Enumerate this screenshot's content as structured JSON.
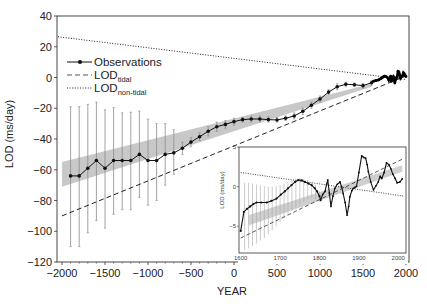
{
  "chart_data": [
    {
      "type": "line",
      "role": "main",
      "title": "",
      "xlabel": "YEAR",
      "ylabel": "LOD (ms/day)",
      "xlim": [
        -2000,
        2000
      ],
      "ylim": [
        -120,
        40
      ],
      "xticks": [
        -2000,
        -1500,
        -1000,
        -500,
        0,
        500,
        1000,
        1500,
        2000
      ],
      "xtick_labels": [
        "−2000",
        "−1500",
        "−1000",
        "−500",
        "0",
        "500",
        "1000",
        "1500",
        "2000"
      ],
      "yticks": [
        -120,
        -100,
        -80,
        -60,
        -40,
        -20,
        0,
        20,
        40
      ],
      "ytick_labels": [
        "−120",
        "−100",
        "−80",
        "−60",
        "−40",
        "−20",
        "0",
        "20",
        "40"
      ],
      "grid": false,
      "legend_position": "upper left",
      "legend": [
        {
          "label": "Observations",
          "sub": "",
          "style": "line-marker"
        },
        {
          "label": "LOD",
          "sub": "tidal",
          "style": "dashed"
        },
        {
          "label": "LOD",
          "sub": "non-tidal",
          "style": "dotted"
        }
      ],
      "series": [
        {
          "name": "Observations",
          "style": "line-marker",
          "x": [
            -1900,
            -1800,
            -1700,
            -1600,
            -1500,
            -1400,
            -1300,
            -1200,
            -1100,
            -1000,
            -900,
            -800,
            -700,
            -600,
            -500,
            -400,
            -300,
            -200,
            -100,
            0,
            100,
            200,
            300,
            400,
            500,
            600,
            700,
            800,
            900,
            1000,
            1100,
            1200,
            1300,
            1400,
            1500,
            1600
          ],
          "y": [
            -64,
            -64,
            -59,
            -54,
            -59,
            -54,
            -54,
            -54,
            -50,
            -54,
            -54,
            -50,
            -49,
            -46,
            -42,
            -38.5,
            -35,
            -32,
            -30.5,
            -28.7,
            -27.4,
            -27,
            -27,
            -27.4,
            -27.6,
            -26.5,
            -25,
            -22,
            -18,
            -14,
            -9.5,
            -6,
            -4.4,
            -4.7,
            -5.3,
            -3.4
          ],
          "err_low": [
            -110,
            -110,
            -101,
            -93,
            -98,
            -89,
            -86,
            -86,
            -78,
            -83,
            -80,
            -70,
            -63,
            -50,
            -45,
            -41,
            -38,
            -35,
            -33,
            -31,
            -29,
            -29,
            -29,
            -29,
            -29,
            -28,
            -27,
            -24,
            -20,
            -16,
            -11,
            -8,
            -6,
            -6,
            -7,
            -5
          ],
          "err_high": [
            -19,
            -19,
            -17.5,
            -16,
            -21,
            -19.6,
            -23,
            -22.6,
            -21.8,
            -27,
            -30,
            -30,
            -34,
            -42,
            -39,
            -36,
            -32,
            -29,
            -28,
            -26.5,
            -26,
            -25,
            -25,
            -25.5,
            -26,
            -25,
            -23,
            -20,
            -16,
            -12,
            -8,
            -4,
            -3,
            -3.5,
            -4,
            -2
          ]
        },
        {
          "name": "Observations (telescopic, 1620-2000)",
          "style": "dense-markers",
          "x": [
            1620,
            1650,
            1680,
            1710,
            1730,
            1750,
            1770,
            1790,
            1800,
            1815,
            1822,
            1830,
            1840,
            1852,
            1860,
            1870,
            1878,
            1886,
            1895,
            1907,
            1917,
            1925,
            1937,
            1950,
            1958,
            1970,
            1981,
            1992,
            2000
          ],
          "y": [
            -2.5,
            -2.0,
            -1.6,
            -0.6,
            0.2,
            0.85,
            0.6,
            -0.4,
            -1.7,
            -0.6,
            0.85,
            -2.5,
            -0.2,
            0.6,
            -0.85,
            -3.6,
            -1.3,
            -0.2,
            0.05,
            3.9,
            3.6,
            1.9,
            -0.4,
            0.6,
            1.05,
            3.0,
            2.3,
            1.05,
            0.6
          ]
        },
        {
          "name": "LOD_tidal",
          "style": "dashed",
          "x": [
            -2000,
            2000
          ],
          "y": [
            -90,
            1
          ]
        },
        {
          "name": "LOD_non-tidal",
          "style": "dotted",
          "x": [
            -2000,
            2000
          ],
          "y": [
            26.5,
            -1.3
          ]
        },
        {
          "name": "Uncertainty band",
          "style": "band",
          "x": [
            -2000,
            1600
          ],
          "upper": [
            -55,
            -4
          ],
          "lower": [
            -71,
            -6
          ]
        }
      ]
    },
    {
      "type": "line",
      "role": "inset",
      "title": "",
      "xlabel": "",
      "ylabel": "LOD (ms/day)",
      "xlim": [
        1600,
        2015
      ],
      "ylim": [
        -7.5,
        5.5
      ],
      "xticks": [
        1600,
        1700,
        1800,
        1900,
        2000
      ],
      "xtick_labels": [
        "1600",
        "1700",
        "1800",
        "1900",
        "2000"
      ],
      "yticks": [
        -5,
        0,
        5
      ],
      "ytick_labels": [
        "−5",
        "0",
        "5"
      ],
      "grid": false,
      "series": [
        {
          "name": "Observations",
          "style": "line-marker",
          "x": [
            1600,
            1608,
            1616,
            1624,
            1632,
            1640,
            1652,
            1666,
            1678,
            1691,
            1702,
            1712,
            1720,
            1729,
            1738,
            1746,
            1755,
            1763,
            1772,
            1780,
            1788,
            1794,
            1800,
            1803,
            1808,
            1814,
            1818,
            1821,
            1825,
            1829,
            1834,
            1839,
            1845,
            1852,
            1856,
            1860,
            1865,
            1870,
            1874,
            1877,
            1882,
            1886,
            1890,
            1894,
            1900,
            1907,
            1912,
            1917,
            1921,
            1924,
            1930,
            1937,
            1943,
            1949,
            1954,
            1958,
            1964,
            1970,
            1976,
            1981,
            1986,
            1992,
            1997,
            2004,
            2010
          ],
          "y": [
            -5.6,
            -3.2,
            -2.8,
            -2.5,
            -2.2,
            -2.0,
            -2.0,
            -2.0,
            -1.8,
            -1.5,
            -1.0,
            -0.6,
            -0.2,
            0.2,
            0.6,
            0.85,
            0.8,
            0.6,
            0.4,
            0.2,
            -0.2,
            -0.6,
            -1.2,
            -1.7,
            -1.0,
            -0.6,
            0.3,
            0.85,
            -0.8,
            -2.5,
            -1.2,
            -0.2,
            0.3,
            0.6,
            0.0,
            -0.85,
            -2.0,
            -3.6,
            -2.5,
            -1.3,
            -0.5,
            -0.2,
            -0.1,
            0.05,
            1.8,
            3.9,
            3.7,
            3.6,
            2.8,
            1.9,
            0.6,
            -0.4,
            0.1,
            0.6,
            1.3,
            1.05,
            1.8,
            3.0,
            2.8,
            2.3,
            1.6,
            1.05,
            0.5,
            0.6,
            1.0
          ]
        },
        {
          "name": "Error bars",
          "style": "errorbars",
          "x": [
            1610,
            1620,
            1630,
            1640,
            1650,
            1660,
            1670,
            1680,
            1690,
            1700,
            1710,
            1720,
            1730,
            1740,
            1750,
            1760,
            1770,
            1780,
            1790,
            1800
          ],
          "low": [
            -8,
            -7.8,
            -7.5,
            -7.2,
            -6.8,
            -6.5,
            -6.0,
            -5.5,
            -5.0,
            -4.5,
            -4.0,
            -3.5,
            -3.0,
            -2.6,
            -2.2,
            -1.9,
            -1.6,
            -1.5,
            -1.6,
            -1.9
          ],
          "high": [
            0.5,
            0.5,
            0.4,
            0.3,
            0.2,
            0.1,
            0.0,
            0.0,
            0.1,
            0.2,
            0.4,
            0.6,
            0.8,
            1.0,
            1.1,
            1.0,
            0.9,
            0.6,
            0.2,
            -0.6
          ]
        },
        {
          "name": "LOD_tidal",
          "style": "dashed",
          "x": [
            1600,
            2015
          ],
          "y": [
            -6.5,
            3.6
          ]
        },
        {
          "name": "LOD_non-tidal",
          "style": "dotted",
          "x": [
            1600,
            2015
          ],
          "y": [
            1.8,
            -1.2
          ]
        },
        {
          "name": "Uncertainty band",
          "style": "band",
          "x": [
            1620,
            2010
          ],
          "upper": [
            -3.6,
            2.7
          ],
          "lower": [
            -4.9,
            1.9
          ]
        }
      ]
    }
  ]
}
